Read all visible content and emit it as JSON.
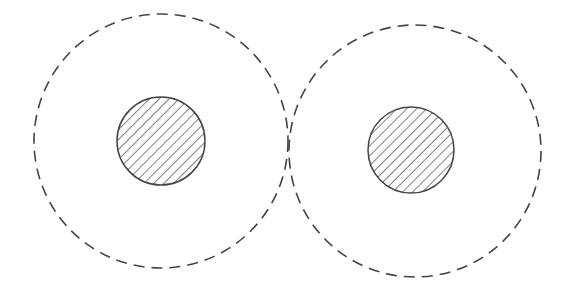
{
  "diagram": {
    "background": "#ffffff",
    "stroke_color": "#444444",
    "hatch_color": "#3a3a3a",
    "elements": [
      {
        "name": "left-unit",
        "outer": {
          "cx": 161,
          "cy": 141,
          "r": 127,
          "style": "dashed"
        },
        "inner": {
          "cx": 161,
          "cy": 141,
          "r": 44,
          "style": "solid-hatched"
        }
      },
      {
        "name": "right-unit",
        "outer": {
          "cx": 415,
          "cy": 151,
          "r": 126,
          "style": "dashed"
        },
        "inner": {
          "cx": 411,
          "cy": 150,
          "r": 43,
          "style": "solid-hatched"
        }
      }
    ]
  }
}
